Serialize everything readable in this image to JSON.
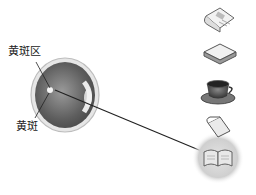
{
  "diagram": {
    "labels": {
      "macula_area": "黄斑区",
      "macula": "黄斑"
    },
    "objects": [
      {
        "name": "newspaper",
        "caption": "新闻"
      },
      {
        "name": "book-closed"
      },
      {
        "name": "coffee-cup"
      },
      {
        "name": "notepad"
      },
      {
        "name": "open-book-highlighted"
      }
    ],
    "colors": {
      "line": "#222222",
      "eye_dark": "#6a6a6a",
      "eye_light": "#dcdcdc"
    }
  }
}
